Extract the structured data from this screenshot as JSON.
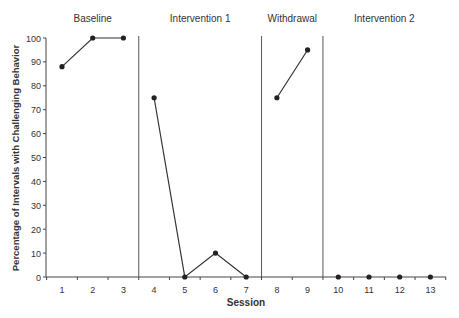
{
  "chart_data": {
    "type": "line",
    "title": "",
    "xlabel": "Session",
    "ylabel": "Percentage of Intervals with Challenging Behavior",
    "ylim": [
      0,
      100
    ],
    "yticks": [
      0,
      10,
      20,
      30,
      40,
      50,
      60,
      70,
      80,
      90,
      100
    ],
    "xticks": [
      1,
      2,
      3,
      4,
      5,
      6,
      7,
      8,
      9,
      10,
      11,
      12,
      13
    ],
    "grid": false,
    "phases": [
      {
        "name": "Baseline",
        "sessions": [
          1,
          2,
          3
        ],
        "values": [
          88,
          100,
          100
        ]
      },
      {
        "name": "Intervention 1",
        "sessions": [
          4,
          5,
          6,
          7
        ],
        "values": [
          75,
          0,
          10,
          0
        ]
      },
      {
        "name": "Withdrawal",
        "sessions": [
          8,
          9
        ],
        "values": [
          75,
          95
        ]
      },
      {
        "name": "Intervention 2",
        "sessions": [
          10,
          11,
          12,
          13
        ],
        "values": [
          0,
          0,
          0,
          0
        ]
      }
    ],
    "phase_change_lines_after_sessions": [
      3.5,
      7.5,
      9.5
    ]
  }
}
